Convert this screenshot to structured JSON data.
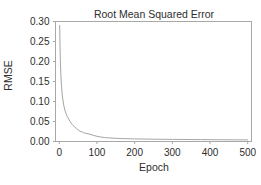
{
  "chart_data": {
    "type": "line",
    "title": "Root Mean Squared Error",
    "xlabel": "Epoch",
    "ylabel": "RMSE",
    "xlim": [
      -10,
      510
    ],
    "ylim": [
      0.0,
      0.3
    ],
    "xticks": [
      0,
      100,
      200,
      300,
      400,
      500
    ],
    "xtick_labels": [
      "0",
      "100",
      "200",
      "300",
      "400",
      "500"
    ],
    "yticks": [
      0.0,
      0.05,
      0.1,
      0.15,
      0.2,
      0.25,
      0.3
    ],
    "ytick_labels": [
      "0.00",
      "0.05",
      "0.10",
      "0.15",
      "0.20",
      "0.25",
      "0.30"
    ],
    "grid": false,
    "legend": false,
    "line_color": "#9a9a9a",
    "axis_color": "#a8a8a8",
    "background": "#ffffff",
    "series": [
      {
        "name": "RMSE",
        "x": [
          1,
          2,
          3,
          4,
          5,
          6,
          8,
          10,
          12,
          15,
          18,
          21,
          25,
          30,
          35,
          40,
          45,
          50,
          55,
          60,
          65,
          70,
          80,
          90,
          100,
          110,
          120,
          130,
          140,
          150,
          165,
          180,
          200,
          220,
          240,
          260,
          280,
          300,
          325,
          350,
          375,
          400,
          425,
          450,
          470,
          485,
          495,
          500
        ],
        "y": [
          0.29,
          0.238,
          0.2,
          0.173,
          0.153,
          0.138,
          0.116,
          0.101,
          0.09,
          0.078,
          0.07,
          0.063,
          0.056,
          0.048,
          0.042,
          0.037,
          0.033,
          0.029,
          0.026,
          0.024,
          0.022,
          0.0205,
          0.0185,
          0.0155,
          0.013,
          0.0113,
          0.01,
          0.0091,
          0.0085,
          0.008,
          0.0074,
          0.007,
          0.0065,
          0.0062,
          0.0059,
          0.0057,
          0.0055,
          0.0053,
          0.0051,
          0.0049,
          0.0047,
          0.0046,
          0.0044,
          0.0043,
          0.0042,
          0.0041,
          0.004,
          0.004
        ]
      }
    ]
  }
}
